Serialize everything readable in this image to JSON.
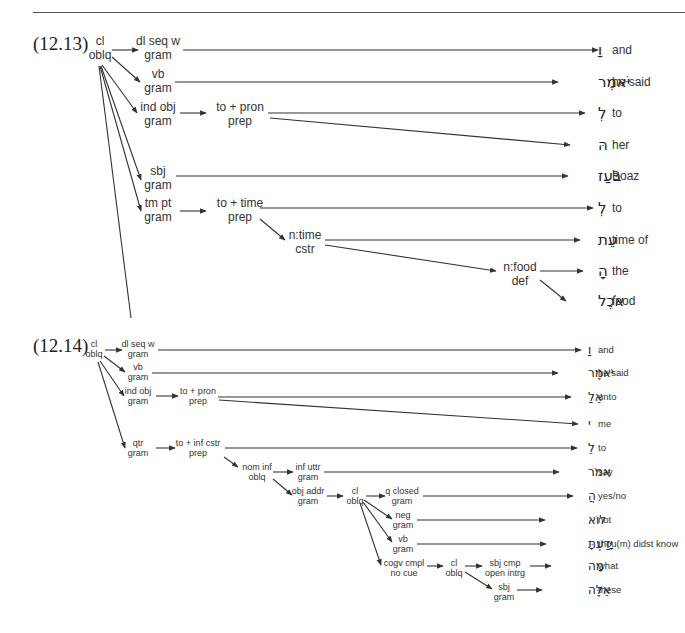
{
  "examples": [
    {
      "label": "(12.13)",
      "label_pos": [
        33,
        50
      ],
      "font": {
        "label": 19,
        "node": 12,
        "heb": 15,
        "gloss": 12,
        "lh": 14
      },
      "nodes": [
        {
          "id": "root",
          "lines": [
            "cl",
            "oblq"
          ],
          "x": 100,
          "y": 45
        },
        {
          "id": "dlseq",
          "lines": [
            "dl seq w",
            "gram"
          ],
          "x": 158,
          "y": 45
        },
        {
          "id": "vb",
          "lines": [
            "vb",
            "gram"
          ],
          "x": 158,
          "y": 78
        },
        {
          "id": "indobj",
          "lines": [
            "ind obj",
            "gram"
          ],
          "x": 158,
          "y": 111
        },
        {
          "id": "topron",
          "lines": [
            "to + pron",
            "prep"
          ],
          "x": 240,
          "y": 111
        },
        {
          "id": "sbj",
          "lines": [
            "sbj",
            "gram"
          ],
          "x": 158,
          "y": 175
        },
        {
          "id": "tmpt",
          "lines": [
            "tm pt",
            "gram"
          ],
          "x": 158,
          "y": 207
        },
        {
          "id": "totime",
          "lines": [
            "to + time",
            "prep"
          ],
          "x": 240,
          "y": 207
        },
        {
          "id": "ntime",
          "lines": [
            "n:time",
            "cstr"
          ],
          "x": 305,
          "y": 239
        },
        {
          "id": "nfood",
          "lines": [
            "n:food",
            "def"
          ],
          "x": 520,
          "y": 271
        }
      ],
      "edges": [
        {
          "from": [
            112,
            50
          ],
          "to": [
            138,
            50
          ],
          "arrow": true
        },
        {
          "from": [
            112,
            57
          ],
          "to": [
            140,
            82
          ],
          "arrow": true
        },
        {
          "from": [
            102,
            65
          ],
          "to": [
            137,
            113
          ],
          "arrow": true
        },
        {
          "from": [
            101,
            66
          ],
          "to": [
            141,
            180
          ],
          "arrow": true
        },
        {
          "from": [
            100,
            66
          ],
          "to": [
            141,
            211
          ],
          "arrow": true
        },
        {
          "from": [
            99,
            66
          ],
          "to": [
            131,
            318
          ],
          "arrow": false
        },
        {
          "from": [
            180,
            113
          ],
          "to": [
            206,
            113
          ],
          "arrow": true
        },
        {
          "from": [
            180,
            211
          ],
          "to": [
            206,
            211
          ],
          "arrow": true
        },
        {
          "from": [
            260,
            219
          ],
          "to": [
            285,
            240
          ],
          "arrow": true
        },
        {
          "from": [
            183,
            50
          ],
          "to": [
            598,
            50
          ],
          "arrow": true
        },
        {
          "from": [
            175,
            82
          ],
          "to": [
            558,
            82
          ],
          "arrow": true
        },
        {
          "from": [
            268,
            113
          ],
          "to": [
            585,
            113
          ],
          "arrow": true
        },
        {
          "from": [
            270,
            118
          ],
          "to": [
            570,
            145
          ],
          "arrow": true
        },
        {
          "from": [
            176,
            176
          ],
          "to": [
            568,
            176
          ],
          "arrow": true
        },
        {
          "from": [
            260,
            208
          ],
          "to": [
            593,
            208
          ],
          "arrow": true
        },
        {
          "from": [
            325,
            240
          ],
          "to": [
            580,
            240
          ],
          "arrow": true
        },
        {
          "from": [
            325,
            245
          ],
          "to": [
            496,
            271
          ],
          "arrow": true
        },
        {
          "from": [
            540,
            271
          ],
          "to": [
            583,
            271
          ],
          "arrow": true
        },
        {
          "from": [
            540,
            280
          ],
          "to": [
            566,
            301
          ],
          "arrow": true
        }
      ],
      "words": [
        {
          "hebrew": "וַ",
          "gloss": "and",
          "y": 50
        },
        {
          "hebrew": "יֹּאמֶר",
          "gloss": "he said",
          "y": 82
        },
        {
          "hebrew": "לְ",
          "gloss": "to",
          "y": 113
        },
        {
          "hebrew": "הּ",
          "gloss": "her",
          "y": 145
        },
        {
          "hebrew": "בֹּעַז",
          "gloss": "Boaz",
          "y": 176
        },
        {
          "hebrew": "לְ",
          "gloss": "to",
          "y": 208
        },
        {
          "hebrew": "עֵת",
          "gloss": "time of",
          "y": 240
        },
        {
          "hebrew": "הָ",
          "gloss": "the",
          "y": 271
        },
        {
          "hebrew": "אֹכֶל",
          "gloss": "food",
          "y": 301
        }
      ],
      "heb_right": 598,
      "gloss_x": 612
    },
    {
      "label": "(12.14)",
      "label_pos": [
        33,
        352
      ],
      "font": {
        "label": 19,
        "node": 9,
        "heb": 12,
        "gloss": 9.5,
        "lh": 10
      },
      "nodes": [
        {
          "id": "root",
          "lines": [
            "cl",
            "oblq"
          ],
          "x": 94,
          "y": 347
        },
        {
          "id": "dlseq",
          "lines": [
            "dl seq w",
            "gram"
          ],
          "x": 138,
          "y": 347
        },
        {
          "id": "vb",
          "lines": [
            "vb",
            "gram"
          ],
          "x": 138,
          "y": 370
        },
        {
          "id": "indobj",
          "lines": [
            "ind obj",
            "gram"
          ],
          "x": 138,
          "y": 394
        },
        {
          "id": "topron",
          "lines": [
            "to + pron",
            "prep"
          ],
          "x": 198,
          "y": 394
        },
        {
          "id": "qtr",
          "lines": [
            "qtr",
            "gram"
          ],
          "x": 138,
          "y": 446
        },
        {
          "id": "toinf",
          "lines": [
            "to + inf cstr",
            "prep"
          ],
          "x": 198,
          "y": 446
        },
        {
          "id": "nominf",
          "lines": [
            "nom inf",
            "oblq"
          ],
          "x": 257,
          "y": 470
        },
        {
          "id": "infuttr",
          "lines": [
            "inf uttr",
            "gram"
          ],
          "x": 308,
          "y": 470
        },
        {
          "id": "objaddr",
          "lines": [
            "obj addr",
            "gram"
          ],
          "x": 308,
          "y": 494
        },
        {
          "id": "cl2",
          "lines": [
            "cl",
            "oblq"
          ],
          "x": 355,
          "y": 494
        },
        {
          "id": "qclosed",
          "lines": [
            "q closed",
            "gram"
          ],
          "x": 402,
          "y": 494
        },
        {
          "id": "neg",
          "lines": [
            "neg",
            "gram"
          ],
          "x": 403,
          "y": 518
        },
        {
          "id": "vb2",
          "lines": [
            "vb",
            "gram"
          ],
          "x": 403,
          "y": 542
        },
        {
          "id": "cogv",
          "lines": [
            "cogv cmpl",
            "no cue"
          ],
          "x": 404,
          "y": 566
        },
        {
          "id": "cl3",
          "lines": [
            "cl",
            "oblq"
          ],
          "x": 454,
          "y": 566
        },
        {
          "id": "sbjcmp",
          "lines": [
            "sbj cmp",
            "open intrg"
          ],
          "x": 505,
          "y": 566
        },
        {
          "id": "sbj",
          "lines": [
            "sbj",
            "gram"
          ],
          "x": 504,
          "y": 590
        }
      ],
      "edges": [
        {
          "from": [
            105,
            350
          ],
          "to": [
            122,
            350
          ],
          "arrow": true
        },
        {
          "from": [
            104,
            356
          ],
          "to": [
            125,
            372
          ],
          "arrow": true
        },
        {
          "from": [
            100,
            361
          ],
          "to": [
            124,
            396
          ],
          "arrow": true
        },
        {
          "from": [
            98,
            362
          ],
          "to": [
            125,
            448
          ],
          "arrow": true
        },
        {
          "from": [
            156,
            396
          ],
          "to": [
            178,
            396
          ],
          "arrow": true
        },
        {
          "from": [
            156,
            448
          ],
          "to": [
            175,
            448
          ],
          "arrow": true
        },
        {
          "from": [
            224,
            457
          ],
          "to": [
            238,
            467
          ],
          "arrow": true
        },
        {
          "from": [
            273,
            472
          ],
          "to": [
            293,
            472
          ],
          "arrow": true
        },
        {
          "from": [
            273,
            479
          ],
          "to": [
            292,
            495
          ],
          "arrow": true
        },
        {
          "from": [
            327,
            496
          ],
          "to": [
            343,
            496
          ],
          "arrow": true
        },
        {
          "from": [
            366,
            496
          ],
          "to": [
            385,
            496
          ],
          "arrow": true
        },
        {
          "from": [
            364,
            500
          ],
          "to": [
            392,
            519
          ],
          "arrow": true
        },
        {
          "from": [
            363,
            502
          ],
          "to": [
            392,
            542
          ],
          "arrow": true
        },
        {
          "from": [
            360,
            503
          ],
          "to": [
            381,
            565
          ],
          "arrow": true
        },
        {
          "from": [
            427,
            566
          ],
          "to": [
            443,
            566
          ],
          "arrow": true
        },
        {
          "from": [
            465,
            566
          ],
          "to": [
            482,
            566
          ],
          "arrow": true
        },
        {
          "from": [
            465,
            572
          ],
          "to": [
            492,
            589
          ],
          "arrow": true
        },
        {
          "from": [
            158,
            350
          ],
          "to": [
            581,
            350
          ],
          "arrow": true
        },
        {
          "from": [
            152,
            373
          ],
          "to": [
            558,
            373
          ],
          "arrow": true
        },
        {
          "from": [
            218,
            397
          ],
          "to": [
            571,
            397
          ],
          "arrow": true
        },
        {
          "from": [
            219,
            400
          ],
          "to": [
            578,
            424
          ],
          "arrow": true
        },
        {
          "from": [
            225,
            448
          ],
          "to": [
            577,
            448
          ],
          "arrow": true
        },
        {
          "from": [
            324,
            472
          ],
          "to": [
            559,
            472
          ],
          "arrow": true
        },
        {
          "from": [
            423,
            496
          ],
          "to": [
            573,
            496
          ],
          "arrow": true
        },
        {
          "from": [
            417,
            520
          ],
          "to": [
            545,
            520
          ],
          "arrow": true
        },
        {
          "from": [
            417,
            544
          ],
          "to": [
            546,
            544
          ],
          "arrow": true
        },
        {
          "from": [
            530,
            566
          ],
          "to": [
            551,
            566
          ],
          "arrow": true
        },
        {
          "from": [
            517,
            590
          ],
          "to": [
            542,
            590
          ],
          "arrow": true
        }
      ],
      "words": [
        {
          "hebrew": "וַ",
          "gloss": "and",
          "y": 350
        },
        {
          "hebrew": "יֹּאמֶר",
          "gloss": "he said",
          "y": 373
        },
        {
          "hebrew": "אֵלַ",
          "gloss": "unto",
          "y": 397
        },
        {
          "hebrew": "י",
          "gloss": "me",
          "y": 424
        },
        {
          "hebrew": "לֵ",
          "gloss": "to",
          "y": 448
        },
        {
          "hebrew": "אמֹר",
          "gloss": "say",
          "y": 472
        },
        {
          "hebrew": "הֲ",
          "gloss": "yes/no",
          "y": 496
        },
        {
          "hebrew": "לוֹא",
          "gloss": "not",
          "y": 520
        },
        {
          "hebrew": "יָדַעְתָּ",
          "gloss": "thou(m) didst know",
          "y": 544
        },
        {
          "hebrew": "מָה",
          "gloss": "what",
          "y": 566
        },
        {
          "hebrew": "אֵלֶּה",
          "gloss": "these",
          "y": 590
        }
      ],
      "heb_right": 588,
      "gloss_x": 598
    }
  ]
}
